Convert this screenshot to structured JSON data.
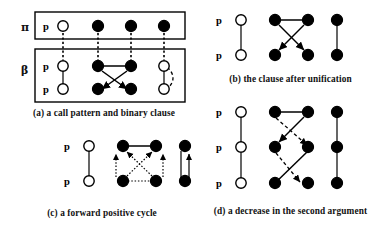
{
  "figure": {
    "background_color": "#ffffff",
    "ink_color": "#000000",
    "node_legend": {
      "open_circle": "unbound / variable argument",
      "filled_circle": "bound / instantiated argument"
    }
  },
  "panels": [
    {
      "id": "a",
      "caption": "(a) a call pattern and binary clause",
      "group_labels": {
        "top": "π",
        "bottom": "β"
      },
      "has_boxes": true,
      "rows": [
        {
          "group": "π",
          "predicate": "p",
          "nodes": [
            "open",
            "filled",
            "filled",
            "filled"
          ]
        },
        {
          "group": "β",
          "predicate": "p",
          "nodes": [
            "open",
            "filled",
            "filled",
            "open"
          ]
        },
        {
          "group": "β",
          "predicate": "p",
          "nodes": [
            "open",
            "filled",
            "filled",
            "open"
          ]
        }
      ],
      "edges": [
        {
          "kind": "dotted-vertical",
          "from": "r0c0",
          "to": "r1c0"
        },
        {
          "kind": "dotted-vertical",
          "from": "r0c1",
          "to": "r1c1"
        },
        {
          "kind": "dotted-vertical",
          "from": "r0c2",
          "to": "r1c2"
        },
        {
          "kind": "dotted-vertical",
          "from": "r0c3",
          "to": "r1c3"
        },
        {
          "kind": "solid",
          "from": "r1c0",
          "to": "r2c0"
        },
        {
          "kind": "solid",
          "from": "r1c1",
          "to": "r1c2"
        },
        {
          "kind": "arrow",
          "from": "r1c1",
          "to": "r2c2"
        },
        {
          "kind": "arrow",
          "from": "r1c2",
          "to": "r2c1"
        },
        {
          "kind": "solid",
          "from": "r1c3",
          "to": "r2c3"
        },
        {
          "kind": "dashed-curve",
          "from": "r1c3",
          "to": "r2c3"
        }
      ]
    },
    {
      "id": "b",
      "caption": "(b) the clause after unification",
      "group_labels": {
        "top": "",
        "bottom": ""
      },
      "has_boxes": false,
      "rows": [
        {
          "group": "",
          "predicate": "p",
          "nodes": [
            "open",
            "filled",
            "filled",
            "filled"
          ]
        },
        {
          "group": "",
          "predicate": "p",
          "nodes": [
            "open",
            "filled",
            "filled",
            "filled"
          ]
        }
      ],
      "edges": [
        {
          "kind": "solid",
          "from": "r0c0",
          "to": "r1c0"
        },
        {
          "kind": "solid",
          "from": "r0c1",
          "to": "r0c2"
        },
        {
          "kind": "arrow",
          "from": "r0c1",
          "to": "r1c2"
        },
        {
          "kind": "arrow",
          "from": "r0c2",
          "to": "r1c1"
        },
        {
          "kind": "solid",
          "from": "r0c3",
          "to": "r1c3"
        }
      ]
    },
    {
      "id": "c",
      "caption": "(c) a forward positive cycle",
      "group_labels": {
        "top": "",
        "bottom": ""
      },
      "has_boxes": false,
      "rows": [
        {
          "group": "",
          "predicate": "p",
          "nodes": [
            "open",
            "filled",
            "filled",
            "filled"
          ]
        },
        {
          "group": "",
          "predicate": "p",
          "nodes": [
            "open",
            "filled",
            "filled",
            "filled"
          ]
        }
      ],
      "edges": [
        {
          "kind": "solid",
          "from": "r0c0",
          "to": "r1c0"
        },
        {
          "kind": "solid",
          "from": "r0c1",
          "to": "r0c2"
        },
        {
          "kind": "dotted-arrow",
          "from": "r1c1",
          "to": "r0c1"
        },
        {
          "kind": "dotted-arrow",
          "from": "r1c2",
          "to": "r0c2"
        },
        {
          "kind": "dotted-arrow",
          "from": "r1c1",
          "to": "r0c2"
        },
        {
          "kind": "dotted-arrow",
          "from": "r1c2",
          "to": "r0c1"
        },
        {
          "kind": "solid",
          "from": "r0c3",
          "to": "r1c3"
        },
        {
          "kind": "arrow-up",
          "from": "r1c3",
          "to": "r0c3"
        }
      ]
    },
    {
      "id": "d",
      "caption": "(d) a decrease in the second argument",
      "group_labels": {
        "top": "",
        "bottom": ""
      },
      "has_boxes": false,
      "rows": [
        {
          "group": "",
          "predicate": "p",
          "nodes": [
            "open",
            "filled",
            "filled",
            "filled"
          ]
        },
        {
          "group": "",
          "predicate": "p",
          "nodes": [
            "open",
            "filled",
            "filled",
            "filled"
          ]
        },
        {
          "group": "",
          "predicate": "p",
          "nodes": [
            "open",
            "filled",
            "filled",
            "filled"
          ]
        }
      ],
      "edges": [
        {
          "kind": "solid",
          "from": "r0c0",
          "to": "r1c0"
        },
        {
          "kind": "solid",
          "from": "r1c0",
          "to": "r2c0"
        },
        {
          "kind": "solid",
          "from": "r0c1",
          "to": "r0c2"
        },
        {
          "kind": "arrow",
          "from": "r0c2",
          "to": "r1c1"
        },
        {
          "kind": "dashed-arrow",
          "from": "r0c1",
          "to": "r1c2"
        },
        {
          "kind": "arrow",
          "from": "r1c2",
          "to": "r2c1"
        },
        {
          "kind": "dashed-arrow",
          "from": "r1c1",
          "to": "r2c2"
        },
        {
          "kind": "solid",
          "from": "r0c3",
          "to": "r1c3"
        },
        {
          "kind": "solid",
          "from": "r1c3",
          "to": "r2c3"
        }
      ]
    }
  ]
}
